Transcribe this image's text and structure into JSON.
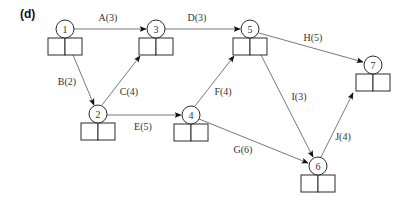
{
  "panel_label": "(d)",
  "colors": {
    "stroke": "#2a2a2a",
    "edge": "#555555",
    "text": "#333333",
    "background": "#ffffff"
  },
  "nodes": [
    {
      "id": "1",
      "label": "1",
      "cx": 65,
      "cy": 29
    },
    {
      "id": "2",
      "label": "2",
      "cx": 98,
      "cy": 114
    },
    {
      "id": "3",
      "label": "3",
      "cx": 156,
      "cy": 29
    },
    {
      "id": "4",
      "label": "4",
      "cx": 191,
      "cy": 115
    },
    {
      "id": "5",
      "label": "5",
      "cx": 250,
      "cy": 29
    },
    {
      "id": "6",
      "label": "6",
      "cx": 318,
      "cy": 166
    },
    {
      "id": "7",
      "label": "7",
      "cx": 373,
      "cy": 65
    }
  ],
  "edges": [
    {
      "id": "A",
      "label": "A(3)",
      "from": "1",
      "to": "3",
      "x1": 74,
      "y1": 29,
      "x2": 146,
      "y2": 29,
      "lx": 108,
      "ly": 21
    },
    {
      "id": "B",
      "label": "B(2)",
      "from": "1",
      "to": "2",
      "x1": 73,
      "y1": 55,
      "x2": 94,
      "y2": 105,
      "lx": 67,
      "ly": 85
    },
    {
      "id": "C",
      "label": "C(4)",
      "from": "2",
      "to": "3",
      "x1": 102,
      "y1": 105,
      "x2": 140,
      "y2": 56,
      "lx": 129,
      "ly": 95
    },
    {
      "id": "D",
      "label": "D(3)",
      "from": "3",
      "to": "5",
      "x1": 165,
      "y1": 29,
      "x2": 240,
      "y2": 29,
      "lx": 197,
      "ly": 21
    },
    {
      "id": "E",
      "label": "E(5)",
      "from": "2",
      "to": "4",
      "x1": 107,
      "y1": 115,
      "x2": 181,
      "y2": 115,
      "lx": 143,
      "ly": 130
    },
    {
      "id": "F",
      "label": "F(4)",
      "from": "4",
      "to": "5",
      "x1": 195,
      "y1": 106,
      "x2": 234,
      "y2": 56,
      "lx": 223,
      "ly": 95
    },
    {
      "id": "G",
      "label": "G(6)",
      "from": "4",
      "to": "6",
      "x1": 199,
      "y1": 119,
      "x2": 308,
      "y2": 163,
      "lx": 243,
      "ly": 153
    },
    {
      "id": "H",
      "label": "H(5)",
      "from": "5",
      "to": "7",
      "x1": 259,
      "y1": 33,
      "x2": 363,
      "y2": 62,
      "lx": 313,
      "ly": 41
    },
    {
      "id": "I",
      "label": "I(3)",
      "from": "5",
      "to": "6",
      "x1": 261,
      "y1": 55,
      "x2": 313,
      "y2": 157,
      "lx": 299,
      "ly": 100
    },
    {
      "id": "J",
      "label": "J(4)",
      "from": "6",
      "to": "7",
      "x1": 321,
      "y1": 157,
      "x2": 353,
      "y2": 93,
      "lx": 343,
      "ly": 140
    }
  ]
}
